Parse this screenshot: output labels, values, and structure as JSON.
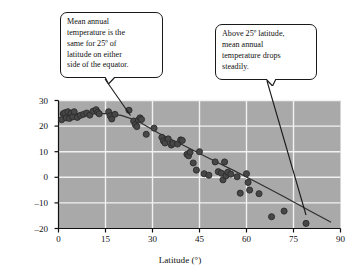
{
  "chart_data": {
    "type": "scatter",
    "title": "",
    "xlabel": "Latitude (°)",
    "ylabel": "Mean annual temperature (°C)",
    "xlim": [
      0,
      90
    ],
    "ylim": [
      -20,
      30
    ],
    "xticks": [
      "0",
      "15",
      "30",
      "45",
      "60",
      "75",
      "90"
    ],
    "yticks": [
      "30",
      "20",
      "10",
      "0",
      "–10",
      "–20"
    ],
    "xtick_values": [
      0,
      15,
      30,
      45,
      60,
      75,
      90
    ],
    "ytick_values": [
      30,
      20,
      10,
      0,
      -10,
      -20
    ],
    "grid": true,
    "grid_color": "#f2f2f2",
    "plot_background": "#a9a9a9",
    "point_color": "#474747",
    "point_edge_color": "#2b2b2b",
    "trend_color": "#2e2e2e",
    "legend": null,
    "points": [
      [
        1,
        22.5
      ],
      [
        1.5,
        24.8
      ],
      [
        2,
        25.2
      ],
      [
        2.5,
        23.2
      ],
      [
        3,
        25.6
      ],
      [
        3.5,
        23.0
      ],
      [
        4,
        25.0
      ],
      [
        4.5,
        23.6
      ],
      [
        5,
        25.6
      ],
      [
        6,
        23.4
      ],
      [
        7,
        24.2
      ],
      [
        8,
        24.6
      ],
      [
        9,
        25.1
      ],
      [
        10,
        24.3
      ],
      [
        11,
        25.8
      ],
      [
        12,
        26.4
      ],
      [
        12.5,
        25.4
      ],
      [
        13,
        24.8
      ],
      [
        16,
        25.6
      ],
      [
        16.5,
        24.0
      ],
      [
        17,
        22.8
      ],
      [
        18,
        24.6
      ],
      [
        22.5,
        26.2
      ],
      [
        24,
        22.0
      ],
      [
        24.5,
        20.6
      ],
      [
        25,
        19.8
      ],
      [
        25.5,
        22.4
      ],
      [
        26,
        23.2
      ],
      [
        26.5,
        22.6
      ],
      [
        28,
        16.8
      ],
      [
        30.5,
        19.2
      ],
      [
        33,
        15.6
      ],
      [
        33.5,
        14.2
      ],
      [
        34,
        13.4
      ],
      [
        35,
        15.0
      ],
      [
        36,
        12.6
      ],
      [
        36.5,
        13.2
      ],
      [
        38,
        13.0
      ],
      [
        39,
        14.6
      ],
      [
        39.5,
        14.4
      ],
      [
        41,
        9.0
      ],
      [
        41.5,
        8.4
      ],
      [
        42,
        9.8
      ],
      [
        43,
        5.6
      ],
      [
        44,
        2.8
      ],
      [
        45,
        10.0
      ],
      [
        46.5,
        1.4
      ],
      [
        48,
        0.8
      ],
      [
        50,
        6.0
      ],
      [
        51,
        2.2
      ],
      [
        52,
        1.6
      ],
      [
        52.5,
        -1.0
      ],
      [
        53,
        6.0
      ],
      [
        53.5,
        0.6
      ],
      [
        54,
        2.0
      ],
      [
        55,
        1.2
      ],
      [
        57,
        0.2
      ],
      [
        58,
        -6.2
      ],
      [
        60,
        1.4
      ],
      [
        60.5,
        -2.0
      ],
      [
        61,
        -5.0
      ],
      [
        64,
        -6.4
      ],
      [
        68,
        -15.4
      ],
      [
        72,
        -13.2
      ],
      [
        79,
        -18.0
      ]
    ],
    "trendline": {
      "x": [
        0.5,
        87
      ],
      "y": [
        24.8,
        -21.5
      ],
      "style": "curve"
    },
    "annotations": [
      {
        "id": "callout-equator",
        "text": "Mean annual temperature is the same for 25º of latitude on either side of the equator.",
        "lines": [
          "Mean annual",
          "temperature is the",
          "same for 25º of",
          "latitude on either",
          "side of the equator."
        ],
        "points_to": [
          23,
          26
        ]
      },
      {
        "id": "callout-drop",
        "text": "Above 25º latitude, mean annual temperature drops steadily.",
        "lines": [
          "Above 25º latitude,",
          "mean annual",
          "temperature drops",
          "steadily."
        ],
        "points_to": [
          79,
          -18
        ]
      }
    ]
  }
}
